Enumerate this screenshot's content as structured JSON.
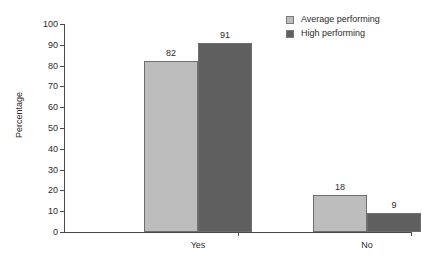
{
  "chart_data": {
    "type": "bar",
    "title": "",
    "xlabel": "",
    "ylabel": "Percentage",
    "categories": [
      "Yes",
      "No"
    ],
    "series": [
      {
        "name": "Average performing",
        "values": [
          82,
          18
        ],
        "color": "#bdbdbd"
      },
      {
        "name": "High performing",
        "values": [
          91,
          9
        ],
        "color": "#5f5f5f"
      }
    ],
    "ylim": [
      0,
      100
    ],
    "yticks": [
      0,
      10,
      20,
      30,
      40,
      50,
      60,
      70,
      80,
      90,
      100
    ],
    "ytick_labels": [
      "0",
      "10",
      "20",
      "30",
      "40",
      "50",
      "60",
      "70",
      "80",
      "90",
      "100"
    ],
    "data_labels": [
      "82",
      "91",
      "18",
      "9"
    ],
    "grid": false,
    "legend_position": "top-right"
  },
  "legend": {
    "entries": [
      {
        "label": "Average performing"
      },
      {
        "label": "High performing"
      }
    ]
  },
  "axes": {
    "y_title": "Percentage"
  }
}
